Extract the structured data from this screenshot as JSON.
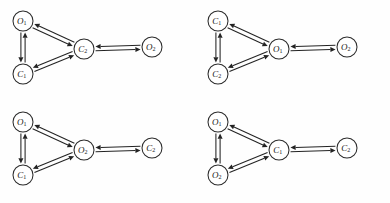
{
  "figure": {
    "panel_count": 4,
    "background_color": "#fefefe",
    "node_stroke_color": "#2b2b2b",
    "edge_color": "#232323",
    "node_radius": 10,
    "panels": [
      {
        "id": "panel-top-left",
        "position": {
          "x": 0,
          "y": 0
        },
        "nodes": [
          {
            "id": "n-tl-top",
            "base": "O",
            "sub": "1",
            "label": "O1",
            "cx": 23,
            "cy": 21
          },
          {
            "id": "n-tl-bottom",
            "base": "C",
            "sub": "1",
            "label": "C1",
            "cx": 23,
            "cy": 74
          },
          {
            "id": "n-tl-center",
            "base": "C",
            "sub": "2",
            "label": "C2",
            "cx": 84,
            "cy": 49
          },
          {
            "id": "n-tl-right",
            "base": "O",
            "sub": "2",
            "label": "O2",
            "cx": 152,
            "cy": 47
          }
        ],
        "edges": [
          {
            "from": "n-tl-top",
            "to": "n-tl-bottom",
            "kind": "bidirectional-pair"
          },
          {
            "from": "n-tl-top",
            "to": "n-tl-center",
            "kind": "bidirectional-pair"
          },
          {
            "from": "n-tl-bottom",
            "to": "n-tl-center",
            "kind": "bidirectional-pair"
          },
          {
            "from": "n-tl-center",
            "to": "n-tl-right",
            "kind": "bidirectional-pair"
          }
        ]
      },
      {
        "id": "panel-top-right",
        "position": {
          "x": 195,
          "y": 0
        },
        "nodes": [
          {
            "id": "n-tr-top",
            "base": "C",
            "sub": "1",
            "label": "C1",
            "cx": 23,
            "cy": 21
          },
          {
            "id": "n-tr-bottom",
            "base": "C",
            "sub": "2",
            "label": "C2",
            "cx": 23,
            "cy": 74
          },
          {
            "id": "n-tr-center",
            "base": "O",
            "sub": "1",
            "label": "O1",
            "cx": 84,
            "cy": 49
          },
          {
            "id": "n-tr-right",
            "base": "O",
            "sub": "2",
            "label": "O2",
            "cx": 152,
            "cy": 47
          }
        ],
        "edges": [
          {
            "from": "n-tr-top",
            "to": "n-tr-bottom",
            "kind": "bidirectional-pair"
          },
          {
            "from": "n-tr-top",
            "to": "n-tr-center",
            "kind": "bidirectional-pair"
          },
          {
            "from": "n-tr-bottom",
            "to": "n-tr-center",
            "kind": "bidirectional-pair"
          },
          {
            "from": "n-tr-center",
            "to": "n-tr-right",
            "kind": "bidirectional-pair"
          }
        ]
      },
      {
        "id": "panel-bottom-left",
        "position": {
          "x": 0,
          "y": 101
        },
        "nodes": [
          {
            "id": "n-bl-top",
            "base": "O",
            "sub": "1",
            "label": "O1",
            "cx": 23,
            "cy": 21
          },
          {
            "id": "n-bl-bottom",
            "base": "C",
            "sub": "1",
            "label": "C1",
            "cx": 23,
            "cy": 74
          },
          {
            "id": "n-bl-center",
            "base": "O",
            "sub": "2",
            "label": "O2",
            "cx": 84,
            "cy": 49
          },
          {
            "id": "n-bl-right",
            "base": "C",
            "sub": "2",
            "label": "C2",
            "cx": 152,
            "cy": 47
          }
        ],
        "edges": [
          {
            "from": "n-bl-top",
            "to": "n-bl-bottom",
            "kind": "bidirectional-pair"
          },
          {
            "from": "n-bl-top",
            "to": "n-bl-center",
            "kind": "bidirectional-pair"
          },
          {
            "from": "n-bl-bottom",
            "to": "n-bl-center",
            "kind": "bidirectional-pair"
          },
          {
            "from": "n-bl-center",
            "to": "n-bl-right",
            "kind": "bidirectional-pair"
          }
        ]
      },
      {
        "id": "panel-bottom-right",
        "position": {
          "x": 195,
          "y": 101
        },
        "nodes": [
          {
            "id": "n-br-top",
            "base": "O",
            "sub": "1",
            "label": "O1",
            "cx": 23,
            "cy": 21
          },
          {
            "id": "n-br-bottom",
            "base": "O",
            "sub": "2",
            "label": "O2",
            "cx": 23,
            "cy": 74
          },
          {
            "id": "n-br-center",
            "base": "C",
            "sub": "1",
            "label": "C1",
            "cx": 84,
            "cy": 49
          },
          {
            "id": "n-br-right",
            "base": "C",
            "sub": "2",
            "label": "C2",
            "cx": 152,
            "cy": 47
          }
        ],
        "edges": [
          {
            "from": "n-br-top",
            "to": "n-br-bottom",
            "kind": "bidirectional-pair"
          },
          {
            "from": "n-br-top",
            "to": "n-br-center",
            "kind": "bidirectional-pair"
          },
          {
            "from": "n-br-bottom",
            "to": "n-br-center",
            "kind": "bidirectional-pair"
          },
          {
            "from": "n-br-center",
            "to": "n-br-right",
            "kind": "bidirectional-pair"
          }
        ]
      }
    ]
  }
}
